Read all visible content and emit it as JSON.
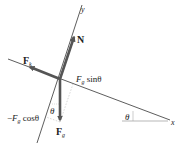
{
  "diagram": {
    "type": "free-body-diagram",
    "colors": {
      "force_arrow": "#555555",
      "axis_line": "#333333",
      "dotted_component": "#aaaaaa",
      "text": "#222222"
    },
    "axes": {
      "x_label": "x",
      "y_label": "y"
    },
    "forces": [
      {
        "id": "N",
        "label": "N",
        "direction": "perpendicular to incline, up"
      },
      {
        "id": "Fk",
        "label": "F",
        "subscript": "k",
        "direction": "along incline, up-slope"
      },
      {
        "id": "Fg",
        "label": "F",
        "subscript": "g",
        "direction": "straight down"
      }
    ],
    "components": {
      "parallel": {
        "prefix": "",
        "base": "F",
        "subscript": "g",
        "suffix": " sinθ"
      },
      "perpendicular": {
        "prefix": "−",
        "base": "F",
        "subscript": "g",
        "suffix": " cosθ"
      }
    },
    "angles": {
      "incline_angle": "θ",
      "gravity_angle": "θ"
    }
  }
}
